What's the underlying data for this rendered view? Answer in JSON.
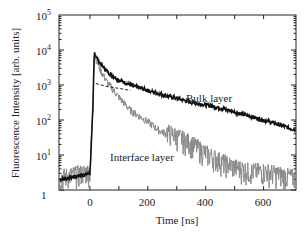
{
  "chart_data": {
    "type": "line",
    "title": "",
    "xlabel": "Time [ns]",
    "ylabel": "Fluorescence Intensity [arb. units]",
    "xlim": [
      -107,
      712
    ],
    "ylim": [
      1,
      100000
    ],
    "yscale": "log",
    "grid": false,
    "legend": "none (inline annotations)",
    "x_ticks": [
      0,
      200,
      400,
      600
    ],
    "x_minor_ticks": [
      100,
      300,
      500
    ],
    "y_ticks": [
      "1",
      "10^1",
      "10^2",
      "10^3",
      "10^4",
      "10^5"
    ],
    "series": [
      {
        "name": "Bulk layer",
        "style": "solid thick black",
        "x": [
          -100,
          0,
          10,
          15,
          20,
          35,
          60,
          100,
          140,
          200,
          260,
          300,
          345,
          400,
          450,
          500,
          550,
          600,
          650,
          700
        ],
        "y": [
          2,
          3,
          200,
          9000,
          7000,
          4200,
          2400,
          1400,
          1000,
          700,
          500,
          420,
          330,
          270,
          220,
          170,
          130,
          100,
          75,
          55
        ]
      },
      {
        "name": "Interface layer",
        "style": "dotted grey, noisy",
        "x": [
          -100,
          0,
          10,
          15,
          20,
          35,
          60,
          100,
          140,
          200,
          240,
          300,
          345,
          400,
          450,
          500,
          550,
          600,
          650,
          700
        ],
        "y": [
          2,
          3,
          200,
          9000,
          6000,
          2800,
          1200,
          450,
          190,
          90,
          50,
          30,
          20,
          10,
          6,
          4,
          3,
          3,
          2.5,
          2
        ]
      },
      {
        "name": "Bulk component (dashed fit)",
        "style": "dashed black",
        "x": [
          20,
          60,
          100,
          140
        ],
        "y": [
          1100,
          900,
          800,
          700
        ]
      }
    ],
    "annotations": [
      {
        "text": "Bulk layer",
        "x": 340,
        "y": 220
      },
      {
        "text": "Interface layer",
        "x": 160,
        "y": 4
      }
    ]
  },
  "axes": {
    "x_title": "Time [ns]",
    "y_title": "Fluorescence Intensity [arb. units]",
    "x_tick_labels": [
      "0",
      "200",
      "400",
      "600"
    ],
    "y_tick_labels": [
      {
        "base": "1",
        "exp": ""
      },
      {
        "base": "10",
        "exp": "1"
      },
      {
        "base": "10",
        "exp": "2"
      },
      {
        "base": "10",
        "exp": "3"
      },
      {
        "base": "10",
        "exp": "4"
      },
      {
        "base": "10",
        "exp": "5"
      }
    ]
  },
  "labels": {
    "bulk": "Bulk layer",
    "interface": "Interface layer"
  }
}
